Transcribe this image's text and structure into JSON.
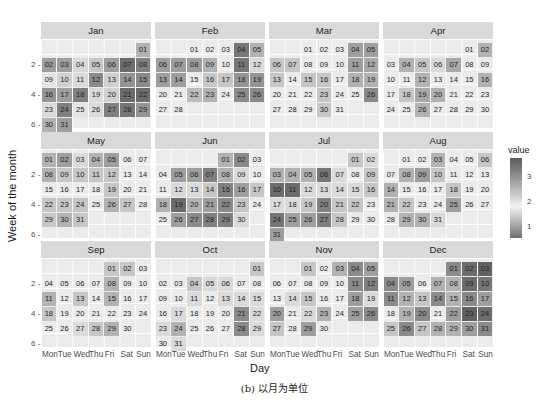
{
  "chart_data": {
    "type": "heatmap",
    "title": "",
    "xlabel": "Day",
    "ylabel": "Week of the month",
    "caption": "(b) 以月为单位",
    "x_tick_labels": [
      "Mon",
      "Tue",
      "Wed",
      "Thu",
      "Fri",
      "Sat",
      "Sun"
    ],
    "y_tick_labels": [
      "2",
      "4",
      "6"
    ],
    "legend": {
      "title": "value",
      "ticks": [
        "3",
        "2",
        "1"
      ],
      "range": [
        0.6,
        3.6
      ]
    },
    "months": [
      {
        "name": "Jan",
        "start_dow": 6,
        "days": 31,
        "values": [
          2.6,
          2.8,
          2.8,
          2.2,
          2.4,
          2.8,
          3.3,
          3.1,
          2.1,
          2.3,
          2.2,
          3.0,
          2.3,
          2.9,
          3.0,
          2.9,
          2.8,
          3.1,
          2.2,
          2.3,
          3.3,
          3.3,
          2.2,
          3.1,
          2.1,
          2.2,
          3.1,
          3.2,
          2.9,
          2.6,
          2.8
        ]
      },
      {
        "name": "Feb",
        "start_dow": 2,
        "days": 28,
        "values": [
          2.0,
          2.0,
          2.0,
          3.2,
          2.6,
          2.8,
          2.8,
          2.8,
          2.6,
          2.0,
          3.2,
          2.2,
          2.8,
          2.8,
          2.0,
          2.4,
          2.4,
          2.9,
          2.9,
          2.0,
          2.0,
          2.5,
          2.6,
          2.0,
          3.0,
          3.0,
          2.0,
          2.0
        ]
      },
      {
        "name": "Mar",
        "start_dow": 2,
        "days": 31,
        "values": [
          2.0,
          2.0,
          2.0,
          2.8,
          2.8,
          2.4,
          2.4,
          2.0,
          2.0,
          2.0,
          2.8,
          2.7,
          2.4,
          2.0,
          2.4,
          2.4,
          2.0,
          2.6,
          2.6,
          2.0,
          2.0,
          2.0,
          2.4,
          2.0,
          2.0,
          3.0,
          2.0,
          2.0,
          2.0,
          2.4,
          2.0
        ]
      },
      {
        "name": "Apr",
        "start_dow": 5,
        "days": 30,
        "values": [
          2.0,
          2.6,
          2.0,
          2.6,
          2.4,
          2.2,
          2.7,
          2.0,
          2.0,
          2.0,
          2.0,
          2.6,
          2.0,
          2.0,
          2.0,
          2.6,
          2.0,
          2.4,
          2.7,
          2.6,
          2.0,
          2.0,
          2.0,
          2.0,
          2.0,
          2.6,
          2.0,
          2.0,
          2.0,
          2.0
        ]
      },
      {
        "name": "May",
        "start_dow": 0,
        "days": 31,
        "values": [
          2.6,
          2.8,
          2.2,
          2.6,
          2.8,
          2.0,
          2.0,
          2.6,
          2.4,
          2.4,
          2.4,
          2.4,
          2.0,
          2.0,
          2.0,
          2.0,
          2.0,
          2.0,
          2.4,
          2.0,
          2.0,
          2.4,
          2.4,
          2.4,
          2.0,
          2.6,
          2.4,
          2.0,
          2.4,
          2.6,
          2.4
        ]
      },
      {
        "name": "Jun",
        "start_dow": 4,
        "days": 30,
        "values": [
          2.6,
          3.0,
          2.0,
          2.0,
          2.8,
          2.8,
          3.1,
          2.6,
          2.2,
          2.0,
          2.0,
          2.2,
          2.2,
          2.4,
          3.1,
          2.8,
          2.4,
          2.6,
          3.3,
          2.6,
          2.8,
          3.0,
          2.4,
          2.0,
          2.0,
          2.8,
          3.0,
          3.1,
          3.1,
          2.2
        ]
      },
      {
        "name": "Jul",
        "start_dow": 5,
        "days": 31,
        "values": [
          2.4,
          2.2,
          2.6,
          2.6,
          2.6,
          3.2,
          2.2,
          2.0,
          2.4,
          3.3,
          3.3,
          2.2,
          2.2,
          2.2,
          2.2,
          2.4,
          2.2,
          2.2,
          2.4,
          3.1,
          2.4,
          2.4,
          2.0,
          3.2,
          2.8,
          2.8,
          3.1,
          2.4,
          2.0,
          2.0,
          2.8
        ]
      },
      {
        "name": "Aug",
        "start_dow": 1,
        "days": 31,
        "values": [
          2.0,
          2.0,
          2.6,
          2.0,
          2.0,
          2.4,
          2.0,
          2.6,
          2.8,
          2.4,
          2.0,
          2.0,
          2.0,
          2.6,
          2.0,
          2.0,
          2.0,
          2.4,
          2.0,
          2.0,
          2.6,
          2.4,
          2.0,
          2.0,
          2.8,
          2.0,
          2.0,
          2.0,
          2.6,
          2.6,
          2.2
        ]
      },
      {
        "name": "Sep",
        "start_dow": 4,
        "days": 30,
        "values": [
          2.4,
          2.4,
          2.0,
          2.0,
          2.0,
          2.0,
          2.0,
          2.6,
          2.0,
          2.0,
          2.6,
          2.0,
          2.4,
          2.0,
          2.6,
          2.0,
          2.0,
          2.4,
          2.0,
          2.0,
          2.0,
          2.0,
          2.0,
          2.0,
          2.0,
          2.0,
          2.2,
          2.4,
          2.6,
          2.0
        ]
      },
      {
        "name": "Oct",
        "start_dow": 6,
        "days": 31,
        "values": [
          2.4,
          2.0,
          2.0,
          2.4,
          2.2,
          2.2,
          2.0,
          2.0,
          2.0,
          2.0,
          2.2,
          2.0,
          2.2,
          2.2,
          2.2,
          2.0,
          2.2,
          2.0,
          2.0,
          2.0,
          3.0,
          2.2,
          2.2,
          2.6,
          2.0,
          2.0,
          2.0,
          3.0,
          2.2,
          2.0,
          2.2
        ]
      },
      {
        "name": "Nov",
        "start_dow": 2,
        "days": 30,
        "values": [
          2.4,
          2.0,
          2.6,
          3.0,
          2.8,
          2.0,
          2.0,
          2.0,
          2.0,
          2.0,
          3.0,
          3.1,
          2.0,
          2.2,
          2.4,
          2.0,
          2.0,
          2.8,
          2.2,
          2.8,
          2.0,
          2.2,
          2.6,
          2.0,
          2.8,
          3.0,
          2.4,
          2.0,
          2.8,
          2.0
        ]
      },
      {
        "name": "Dec",
        "start_dow": 4,
        "days": 31,
        "values": [
          3.0,
          3.3,
          3.4,
          3.0,
          2.8,
          2.0,
          2.6,
          2.6,
          3.3,
          3.2,
          3.0,
          2.6,
          2.4,
          3.0,
          2.6,
          3.0,
          2.8,
          2.0,
          2.6,
          3.0,
          2.0,
          2.8,
          3.4,
          3.3,
          2.4,
          3.0,
          2.4,
          2.6,
          2.6,
          2.8,
          3.0
        ]
      }
    ]
  }
}
